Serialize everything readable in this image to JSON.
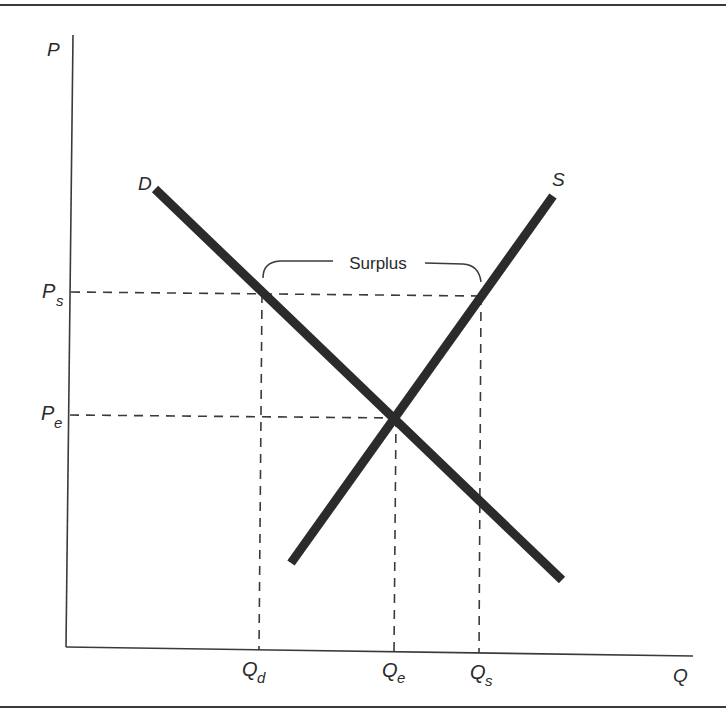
{
  "diagram": {
    "type": "supply-demand",
    "axes": {
      "y_label": "P",
      "x_label": "Q"
    },
    "curves": {
      "demand_label": "D",
      "supply_label": "S"
    },
    "price_levels": {
      "ps_main": "P",
      "ps_sub": "s",
      "pe_main": "P",
      "pe_sub": "e"
    },
    "quantity_levels": {
      "qd_main": "Q",
      "qd_sub": "d",
      "qe_main": "Q",
      "qe_sub": "e",
      "qs_main": "Q",
      "qs_sub": "s"
    },
    "annotation": {
      "surplus_label": "Surplus"
    },
    "colors": {
      "curve": "#2b2b2b",
      "axis": "#3a3a3a",
      "dashed": "#3a3a3a"
    }
  }
}
